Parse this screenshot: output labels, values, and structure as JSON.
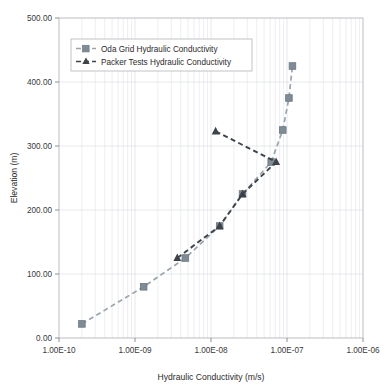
{
  "chart_data": {
    "type": "line",
    "title": "",
    "xlabel": "Hydraulic Conductivity (m/s)",
    "ylabel": "Elevation (m)",
    "xscale": "log",
    "yscale": "linear",
    "xlim": [
      1e-10,
      1e-06
    ],
    "ylim": [
      0,
      500
    ],
    "xticklabels": [
      "1.00E-10",
      "1.00E-09",
      "1.00E-08",
      "1.00E-07",
      "1.00E-06"
    ],
    "xtickvalues": [
      1e-10,
      1e-09,
      1e-08,
      1e-07,
      1e-06
    ],
    "yticklabels": [
      "0.00",
      "100.00",
      "200.00",
      "300.00",
      "400.00",
      "500.00"
    ],
    "ytickvalues": [
      0,
      100,
      200,
      300,
      400,
      500
    ],
    "grid": "minor-vertical-and-major-horizontal",
    "legend_position": "upper-left-inside",
    "series": [
      {
        "name": "Oda Grid Hydraulic Conductivity",
        "marker": "square",
        "color": "#7f8c96",
        "line_color": "#9aa4ad",
        "line_style": "dashed",
        "points": [
          {
            "x": 2e-10,
            "y": 22
          },
          {
            "x": 1.3e-09,
            "y": 80
          },
          {
            "x": 4.6e-09,
            "y": 125
          },
          {
            "x": 1.3e-08,
            "y": 175
          },
          {
            "x": 2.6e-08,
            "y": 225
          },
          {
            "x": 6.2e-08,
            "y": 275
          },
          {
            "x": 8.8e-08,
            "y": 325
          },
          {
            "x": 1.06e-07,
            "y": 375
          },
          {
            "x": 1.18e-07,
            "y": 425
          }
        ]
      },
      {
        "name": "Packer Tests Hydraulic Conductivity",
        "marker": "triangle",
        "color": "#3d4349",
        "line_color": "#3d4349",
        "line_style": "dashed",
        "points": [
          {
            "x": 3.6e-09,
            "y": 125
          },
          {
            "x": 1.3e-08,
            "y": 175
          },
          {
            "x": 2.6e-08,
            "y": 225
          },
          {
            "x": 7.2e-08,
            "y": 275
          },
          {
            "x": 1.15e-08,
            "y": 323
          }
        ]
      }
    ]
  },
  "legend": {
    "entries": [
      {
        "label": "Oda Grid Hydraulic Conductivity"
      },
      {
        "label": "Packer Tests Hydraulic Conductivity"
      }
    ]
  },
  "axes": {
    "x_title": "Hydraulic Conductivity (m/s)",
    "y_title": "Elevation (m)",
    "x_ticks": [
      "1.00E-10",
      "1.00E-09",
      "1.00E-08",
      "1.00E-07",
      "1.00E-06"
    ],
    "y_ticks": [
      "500.00",
      "400.00",
      "300.00",
      "200.00",
      "100.00",
      "0.00"
    ]
  },
  "colors": {
    "oda_marker": "#7f8c96",
    "oda_line": "#9aa4ad",
    "packer_marker": "#3d4349",
    "packer_line": "#3d4349",
    "grid_minor": "#e8eaec",
    "grid_major": "#e2e5e8",
    "axis": "#8b9096",
    "frame": "#b9bdc1"
  }
}
